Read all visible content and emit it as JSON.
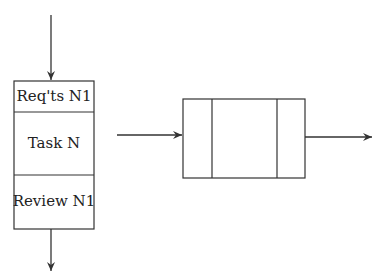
{
  "diagram": {
    "task_box": {
      "top_cell": "Req'ts N1",
      "middle_cell": "Task N",
      "bottom_cell": "Review N1"
    },
    "process_box": {
      "cells": [
        "",
        "",
        ""
      ]
    },
    "colors": {
      "stroke": "#333333",
      "background": "#ffffff"
    }
  }
}
